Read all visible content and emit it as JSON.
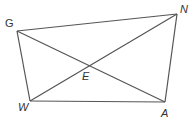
{
  "diagram": {
    "type": "quadrilateral-with-diagonals",
    "stroke_color": "#555555",
    "vertices": [
      {
        "name": "G",
        "x": 17,
        "y": 31,
        "label_x": 5,
        "label_y": 27
      },
      {
        "name": "N",
        "x": 177,
        "y": 14,
        "label_x": 180,
        "label_y": 13
      },
      {
        "name": "A",
        "x": 165,
        "y": 102,
        "label_x": 161,
        "label_y": 116
      },
      {
        "name": "W",
        "x": 30,
        "y": 101,
        "label_x": 18,
        "label_y": 111
      }
    ],
    "intersection": {
      "name": "E",
      "x": 89,
      "y": 65,
      "label_x": 82,
      "label_y": 80
    },
    "labels": {
      "G": "G",
      "N": "N",
      "A": "A",
      "W": "W",
      "E": "E"
    },
    "segments": [
      [
        "G",
        "N"
      ],
      [
        "N",
        "A"
      ],
      [
        "A",
        "W"
      ],
      [
        "W",
        "G"
      ],
      [
        "G",
        "A"
      ],
      [
        "W",
        "N"
      ]
    ]
  }
}
